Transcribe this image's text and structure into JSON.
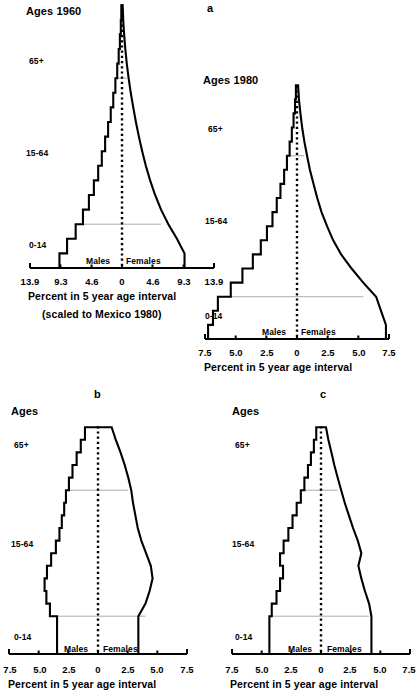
{
  "figure": {
    "panels": [
      "a",
      "b",
      "c"
    ],
    "sex_labels": {
      "left": "Males",
      "right": "Females"
    },
    "age_labels": {
      "old": "65+",
      "working": "15-64",
      "young": "0-14"
    },
    "axis_label": "Percent in 5 year age interval",
    "axis_sublabel": "(scaled to Mexico 1980)"
  },
  "chart_data": [
    {
      "id": "a1960",
      "type": "bar",
      "orientation": "population-pyramid",
      "title": "Ages 1960",
      "panel_letter": "a",
      "xlabel": "Percent in 5 year age interval",
      "xsublabel": "(scaled to Mexico 1980)",
      "ylabel": "Ages",
      "xlim": [
        -13.9,
        13.9
      ],
      "xticks": [
        -13.9,
        -9.3,
        -4.6,
        0,
        4.6,
        9.3,
        13.9
      ],
      "xticklabels": [
        "13.9",
        "9.3",
        "4.6",
        "0",
        "4.6",
        "9.3",
        "13.9"
      ],
      "grid": false,
      "legend": [
        "Males",
        "Females"
      ],
      "annotations": [
        "65+",
        "15-64",
        "0-14"
      ],
      "age_groups": [
        "0-4",
        "5-9",
        "10-14",
        "15-19",
        "20-24",
        "25-29",
        "30-34",
        "35-39",
        "40-44",
        "45-49",
        "50-54",
        "55-59",
        "60-64",
        "65-69",
        "70-74",
        "75-79",
        "80-84",
        "85+"
      ],
      "series": [
        {
          "name": "Males",
          "values": [
            9.45,
            8.3,
            7.0,
            5.9,
            5.0,
            4.25,
            3.6,
            3.05,
            2.55,
            2.1,
            1.7,
            1.32,
            1.0,
            0.72,
            0.5,
            0.32,
            0.18,
            0.1
          ]
        },
        {
          "name": "Females",
          "values": [
            9.45,
            8.3,
            7.0,
            5.9,
            5.0,
            4.25,
            3.6,
            3.05,
            2.55,
            2.1,
            1.7,
            1.32,
            1.0,
            0.72,
            0.5,
            0.32,
            0.18,
            0.1
          ]
        }
      ]
    },
    {
      "id": "a1980",
      "type": "bar",
      "orientation": "population-pyramid",
      "title": "Ages 1980",
      "panel_letter": "a",
      "xlabel": "Percent in 5 year age interval",
      "ylabel": "Ages",
      "xlim": [
        -7.5,
        7.5
      ],
      "xticks": [
        -7.5,
        -5.0,
        -2.5,
        0,
        2.5,
        5.0,
        7.5
      ],
      "xticklabels": [
        "7.5",
        "5.0",
        "2.5",
        "0",
        "2.5",
        "5.0",
        "7.5"
      ],
      "grid": false,
      "legend": [
        "Males",
        "Females"
      ],
      "annotations": [
        "65+",
        "15-64",
        "0-14"
      ],
      "age_groups": [
        "0-4",
        "5-9",
        "10-14",
        "15-19",
        "20-24",
        "25-29",
        "30-34",
        "35-39",
        "40-44",
        "45-49",
        "50-54",
        "55-59",
        "60-64",
        "65-69",
        "70-74",
        "75-79",
        "80-84",
        "85+"
      ],
      "series": [
        {
          "name": "Males",
          "values": [
            7.25,
            6.85,
            6.45,
            5.4,
            4.45,
            3.6,
            2.95,
            2.45,
            2.0,
            1.65,
            1.35,
            1.05,
            0.82,
            0.6,
            0.42,
            0.28,
            0.16,
            0.09
          ]
        },
        {
          "name": "Females",
          "values": [
            7.25,
            6.85,
            6.45,
            5.4,
            4.45,
            3.6,
            2.95,
            2.45,
            2.0,
            1.65,
            1.35,
            1.05,
            0.82,
            0.6,
            0.42,
            0.28,
            0.16,
            0.09
          ]
        }
      ]
    },
    {
      "id": "b",
      "type": "bar",
      "orientation": "population-pyramid",
      "title": "Ages",
      "panel_letter": "b",
      "xlabel": "Percent in 5 year age interval",
      "ylabel": "Ages",
      "xlim": [
        -7.5,
        7.5
      ],
      "xticks": [
        -7.5,
        -5.0,
        -2.5,
        0,
        2.5,
        5.0,
        7.5
      ],
      "xticklabels": [
        "7.5",
        "5.0",
        "2.5",
        "0",
        "2.5",
        "5.0",
        "7.5"
      ],
      "grid": false,
      "legend": [
        "Males",
        "Females"
      ],
      "annotations": [
        "65+",
        "15-64",
        "0-14"
      ],
      "age_groups": [
        "0-4",
        "5-9",
        "10-14",
        "15-19",
        "20-24",
        "25-29",
        "30-34",
        "35-39",
        "40-44",
        "45-49",
        "50-54",
        "55-59",
        "60-64",
        "65-69",
        "70-74",
        "75-79",
        "80-84",
        "85+"
      ],
      "series": [
        {
          "name": "Males",
          "values": [
            3.45,
            3.45,
            3.45,
            4.05,
            4.35,
            4.5,
            4.3,
            3.95,
            3.55,
            3.25,
            3.05,
            2.85,
            2.7,
            2.45,
            2.15,
            1.8,
            1.45,
            1.1
          ]
        },
        {
          "name": "Females",
          "values": [
            3.4,
            3.4,
            3.4,
            4.0,
            4.35,
            4.6,
            4.45,
            4.05,
            3.65,
            3.35,
            3.15,
            2.95,
            2.8,
            2.55,
            2.25,
            1.9,
            1.5,
            1.15
          ]
        }
      ]
    },
    {
      "id": "c",
      "type": "bar",
      "orientation": "population-pyramid",
      "title": "Ages",
      "panel_letter": "c",
      "xlabel": "Percent in 5 year age interval",
      "ylabel": "Ages",
      "xlim": [
        -7.5,
        7.5
      ],
      "xticks": [
        -7.5,
        -5.0,
        -2.5,
        0,
        2.5,
        5.0,
        7.5
      ],
      "xticklabels": [
        "7.5",
        "5.0",
        "2.5",
        "0",
        "2.5",
        "5.0",
        "7.5"
      ],
      "grid": false,
      "legend": [
        "Males",
        "Females"
      ],
      "annotations": [
        "65+",
        "15-64",
        "0-14"
      ],
      "age_groups": [
        "0-4",
        "5-9",
        "10-14",
        "15-19",
        "20-24",
        "25-29",
        "30-34",
        "35-39",
        "40-44",
        "45-49",
        "50-54",
        "55-59",
        "60-64",
        "65-69",
        "70-74",
        "75-79",
        "80-84",
        "85+"
      ],
      "series": [
        {
          "name": "Males",
          "values": [
            4.35,
            4.35,
            4.35,
            4.15,
            3.75,
            3.45,
            3.2,
            3.45,
            3.15,
            2.75,
            2.4,
            2.05,
            1.7,
            1.4,
            1.1,
            0.85,
            0.6,
            0.4
          ]
        },
        {
          "name": "Females",
          "values": [
            4.25,
            4.25,
            4.25,
            4.05,
            3.7,
            3.4,
            3.15,
            3.4,
            3.1,
            2.7,
            2.35,
            2.0,
            1.7,
            1.4,
            1.12,
            0.88,
            0.62,
            0.42
          ]
        }
      ]
    }
  ],
  "panel_a1960": {
    "title": "Ages 1960",
    "letter": "a",
    "ticks": [
      "13.9",
      "9.3",
      "4.6",
      "0",
      "4.6",
      "9.3",
      "13.9"
    ],
    "age_old": "65+",
    "age_work": "15-64",
    "age_young": "0-14",
    "males": "Males",
    "females": "Females",
    "xlabel": "Percent in 5 year age interval",
    "xsublabel": "(scaled to Mexico 1980)"
  },
  "panel_a1980": {
    "title": "Ages 1980",
    "ticks": [
      "7.5",
      "5.0",
      "2.5",
      "0",
      "2.5",
      "5.0",
      "7.5"
    ],
    "age_old": "65+",
    "age_work": "15-64",
    "age_young": "0-14",
    "males": "Males",
    "females": "Females",
    "xlabel": "Percent in 5 year age interval"
  },
  "panel_b": {
    "title": "Ages",
    "letter": "b",
    "ticks": [
      "7.5",
      "5.0",
      "2.5",
      "0",
      "2.5",
      "5.0",
      "7.5"
    ],
    "age_old": "65+",
    "age_work": "15-64",
    "age_young": "0-14",
    "males": "Males",
    "females": "Females",
    "xlabel": "Percent in 5 year age interval"
  },
  "panel_c": {
    "title": "Ages",
    "letter": "c",
    "ticks": [
      "7.5",
      "5.0",
      "2.5",
      "0",
      "2.5",
      "5.0",
      "7.5"
    ],
    "age_old": "65+",
    "age_work": "15-64",
    "age_young": "0-14",
    "males": "Males",
    "females": "Females",
    "xlabel": "Percent in 5 year age interval"
  }
}
